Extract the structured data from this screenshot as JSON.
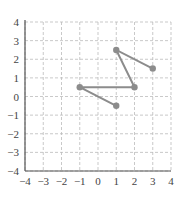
{
  "chart_data": {
    "type": "line",
    "title": "",
    "xlabel": "",
    "ylabel": "",
    "xlim": [
      -4,
      4
    ],
    "ylim": [
      -4,
      4
    ],
    "grid": true,
    "x_ticks": [
      "-4",
      "-3",
      "-2",
      "-1",
      "0",
      "1",
      "2",
      "3",
      "4"
    ],
    "y_ticks": [
      "-4",
      "-3",
      "-2",
      "-1",
      "0",
      "1",
      "2",
      "3",
      "4"
    ],
    "series": [
      {
        "name": "path",
        "points": [
          [
            1,
            -0.5
          ],
          [
            -1,
            0.5
          ],
          [
            2,
            0.5
          ],
          [
            1,
            2.5
          ],
          [
            3,
            1.5
          ]
        ]
      }
    ],
    "colors": {
      "line": "#8c8c8c",
      "marker": "#8c8c8c",
      "grid": "#bbbbbb",
      "axis": "#555555"
    }
  }
}
